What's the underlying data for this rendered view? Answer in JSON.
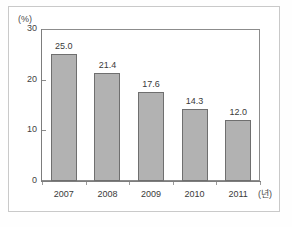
{
  "chart_data": {
    "type": "bar",
    "title": "",
    "subtitle": "",
    "categories": [
      "2007",
      "2008",
      "2009",
      "2010",
      "2011"
    ],
    "values": [
      25.0,
      21.4,
      17.6,
      14.3,
      12.0
    ],
    "data_labels": [
      "25.0",
      "21.4",
      "17.6",
      "14.3",
      "12.0"
    ],
    "xlabel": "(년)",
    "ylabel": "(%)",
    "ylim": [
      0,
      30
    ],
    "ytick_labels": [
      "0",
      "10",
      "20",
      "30"
    ],
    "ytick_values": [
      0,
      10,
      20,
      30
    ],
    "grid": false,
    "legend": null,
    "legend_position": "none",
    "annotations": [],
    "series": [
      {
        "name": "",
        "values": [
          25.0,
          21.4,
          17.6,
          14.3,
          12.0
        ]
      }
    ]
  },
  "style": {
    "bar_fill": "#b2b2b2",
    "bar_border": "#6f6f6f",
    "axis_color": "#7d7d7d",
    "text_color": "#3a3a3a",
    "frame_color": "#c9c9c9",
    "background": "#ffffff"
  }
}
